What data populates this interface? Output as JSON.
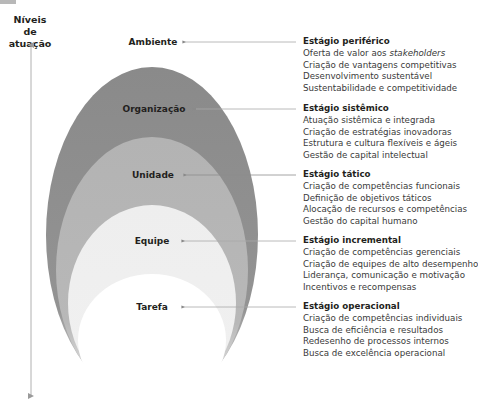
{
  "axis": {
    "label_line1": "Níveis de",
    "label_line2": "atuação"
  },
  "levels": [
    {
      "name": "Ambiente",
      "fill": "#ffffff"
    },
    {
      "name": "Organização",
      "fill": "#8f8f8f"
    },
    {
      "name": "Unidade",
      "fill": "#b5b5b5"
    },
    {
      "name": "Equipe",
      "fill": "#eeeeee"
    },
    {
      "name": "Tarefa",
      "fill": "#ffffff"
    }
  ],
  "stages": [
    {
      "title": "Estágio periférico",
      "items": [
        {
          "text": "Oferta de valor aos ",
          "emphasis": "stakeholders"
        },
        {
          "text": "Criação de vantagens competitivas"
        },
        {
          "text": "Desenvolvimento sustentável"
        },
        {
          "text": "Sustentabilidade e competitividade"
        }
      ]
    },
    {
      "title": "Estágio sistêmico",
      "items": [
        {
          "text": "Atuação sistêmica e integrada"
        },
        {
          "text": "Criação de estratégias inovadoras"
        },
        {
          "text": "Estrutura e cultura flexíveis e ágeis"
        },
        {
          "text": "Gestão de capital intelectual"
        }
      ]
    },
    {
      "title": "Estágio tático",
      "items": [
        {
          "text": "Criação de competências funcionais"
        },
        {
          "text": "Definição de objetivos táticos"
        },
        {
          "text": "Alocação de recursos e competências"
        },
        {
          "text": "Gestão do capital humano"
        }
      ]
    },
    {
      "title": "Estágio incremental",
      "items": [
        {
          "text": "Criação de competências gerenciais"
        },
        {
          "text": "Criação de equipes de alto desempenho"
        },
        {
          "text": "Liderança, comunicação e motivação"
        },
        {
          "text": "Incentivos e recompensas"
        }
      ]
    },
    {
      "title": "Estágio operacional",
      "items": [
        {
          "text": "Criação de competências individuais"
        },
        {
          "text": "Busca de eficiência e resultados"
        },
        {
          "text": "Redesenho de processos internos"
        },
        {
          "text": "Busca de excelência operacional"
        }
      ]
    }
  ],
  "colors": {
    "text": "#231f20",
    "body_text": "#3a3a3a",
    "arrow": "#a0a0a0",
    "ellipse_organizacao": "#8f8f8f",
    "ellipse_unidade": "#b5b5b5",
    "ellipse_equipe": "#eeeeee"
  }
}
